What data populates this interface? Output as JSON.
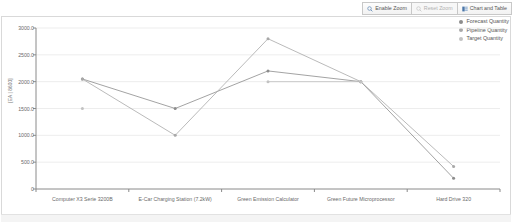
{
  "toolbar": {
    "buttons": [
      {
        "label": "Enable Zoom",
        "icon": "zoom-in-icon",
        "state": "enabled"
      },
      {
        "label": "Reset Zoom",
        "icon": "zoom-reset-icon",
        "state": "disabled"
      },
      {
        "label": "Chart and Table",
        "icon": "chart-and-table-icon",
        "state": "enabled"
      }
    ]
  },
  "legend": {
    "position": "top-right",
    "items": [
      {
        "label": "Forecast Quantity",
        "color": "#8c8c8c"
      },
      {
        "label": "Pipeline Quantity",
        "color": "#a8a8a8"
      },
      {
        "label": "Target Quantity",
        "color": "#c2c2c2"
      }
    ]
  },
  "chart_data": {
    "type": "line",
    "title": "",
    "xlabel": "",
    "ylabel": "[EA | 8600]",
    "ylim": [
      0,
      3000
    ],
    "ytick_labels": [
      "3000.0",
      "2500.0",
      "2000.0",
      "1500.0",
      "1000.0",
      "500.0",
      "0"
    ],
    "ytick_values": [
      3000,
      2500,
      2000,
      1500,
      1000,
      500,
      0
    ],
    "grid": true,
    "categories": [
      "Computer X3 Serie 3200B",
      "E-Car Charging Station (7.2kW)",
      "Green Emission Calculator",
      "Green Future Microprocessor",
      "Hard Drive 320"
    ],
    "series": [
      {
        "name": "Forecast Quantity",
        "color": "#8c8c8c",
        "values": [
          2050,
          1500,
          2200,
          2000,
          200
        ]
      },
      {
        "name": "Pipeline Quantity",
        "color": "#a8a8a8",
        "values": [
          2050,
          1000,
          2800,
          2000,
          420
        ]
      },
      {
        "name": "Target Quantity",
        "color": "#c2c2c2",
        "values": [
          1500,
          null,
          2000,
          2000,
          null
        ]
      }
    ]
  },
  "axis": {
    "ylabel_text": "[EA | 8600]"
  }
}
